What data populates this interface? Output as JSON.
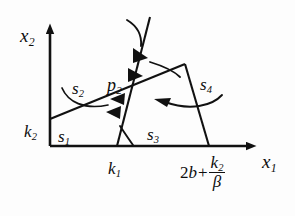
{
  "figure": {
    "type": "phase-portrait-diagram",
    "background_color": "#fdfdfd",
    "stroke_color": "#111111",
    "axes": {
      "x_axis_label": "x",
      "x_axis_label_sub": "1",
      "y_axis_label": "x",
      "y_axis_label_sub": "2",
      "origin_px": [
        50,
        146
      ],
      "x_axis_end_px": [
        258,
        146
      ],
      "y_axis_end_px": [
        50,
        25
      ]
    },
    "tick_labels": [
      {
        "name": "k1",
        "base": "k",
        "sub": "1",
        "x_px": 108,
        "y_px": 160
      },
      {
        "name": "2b-plus-k2-over-beta",
        "lead": "2",
        "var1": "b",
        "op": "+",
        "num": "k",
        "num_sub": "2",
        "den": "β",
        "x_px": 180,
        "y_px": 155
      }
    ],
    "axis_intercept_label": {
      "base": "k",
      "sub": "2",
      "x_px": 24,
      "y_px": 123
    },
    "regions": [
      {
        "name": "s1",
        "base": "s",
        "sub": "1",
        "x_px": 58,
        "y_px": 128
      },
      {
        "name": "s2",
        "base": "s",
        "sub": "2",
        "x_px": 72,
        "y_px": 80
      },
      {
        "name": "s3",
        "base": "s",
        "sub": "3",
        "x_px": 147,
        "y_px": 126
      },
      {
        "name": "s4",
        "base": "s",
        "sub": "4",
        "x_px": 200,
        "y_px": 76
      },
      {
        "name": "p2",
        "base": "p",
        "sub": "2",
        "x_px": 107,
        "y_px": 76
      }
    ]
  }
}
